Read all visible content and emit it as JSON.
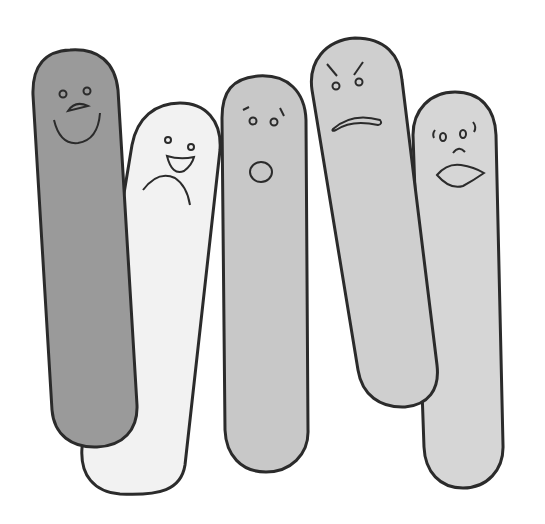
{
  "illustration": {
    "description": "Five pill-shaped characters with different facial expressions",
    "background": "#ffffff",
    "outline_color": "#2b2b2b",
    "characters": [
      {
        "id": "dark-happy",
        "expression": "happy",
        "fill": "#9a9a9a"
      },
      {
        "id": "white-mixed",
        "expression": "laughing-sad",
        "fill": "#f2f2f2"
      },
      {
        "id": "surprised",
        "expression": "surprised",
        "fill": "#c8c8c8"
      },
      {
        "id": "angry",
        "expression": "angry",
        "fill": "#cfcfcf"
      },
      {
        "id": "worried",
        "expression": "worried",
        "fill": "#d6d6d6"
      }
    ]
  }
}
